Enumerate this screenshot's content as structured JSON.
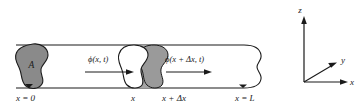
{
  "figure": {
    "type": "diagram",
    "labels": {
      "area": "A",
      "flux_left": "ϕ(x, t)",
      "flux_right": "ϕ(x + Δx, t)",
      "pos_origin": "x = 0",
      "pos_x": "x",
      "pos_x_plus_dx": "x + Δx",
      "pos_end": "x = L",
      "axis_z": "z",
      "axis_y": "y",
      "axis_x": "x"
    },
    "colors": {
      "stroke": "#1a1a1a",
      "blob_fill": "#8a8a8a",
      "blob_fill_light": "#9a9a9a",
      "slab_fill": "#a5a5a5",
      "background": "#ffffff",
      "text": "#1a1a1a"
    },
    "geometry": {
      "tube_top_y": 45,
      "tube_bottom_y": 88,
      "tube_left_x": 14,
      "tube_right_x": 262
    }
  }
}
